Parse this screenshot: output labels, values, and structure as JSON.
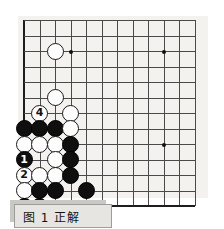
{
  "figure": {
    "caption": "图 1  正解",
    "caption_label": "图",
    "caption_number": "1",
    "caption_text": "正解"
  },
  "board": {
    "type": "go-board-diagram",
    "visible_columns": 12,
    "visible_rows": 12,
    "corner": "bottom-left",
    "line_color": "#4a4a4a",
    "edge_color": "#1d1d1d",
    "background_color": "#f3f2ef",
    "black_color": "#100f0f",
    "white_color": "#fdfdfd",
    "star_points": [
      {
        "col": 4,
        "row": 3
      },
      {
        "col": 10,
        "row": 3
      },
      {
        "col": 10,
        "row": 9
      }
    ],
    "stones": [
      {
        "col": 3,
        "row": 3,
        "color": "white",
        "label": ""
      },
      {
        "col": 3,
        "row": 6,
        "color": "white",
        "label": ""
      },
      {
        "col": 4,
        "row": 7,
        "color": "white",
        "label": ""
      },
      {
        "col": 2,
        "row": 7,
        "color": "white",
        "label": "4"
      },
      {
        "col": 1,
        "row": 8,
        "color": "black",
        "label": ""
      },
      {
        "col": 2,
        "row": 8,
        "color": "black",
        "label": ""
      },
      {
        "col": 3,
        "row": 8,
        "color": "black",
        "label": ""
      },
      {
        "col": 4,
        "row": 8,
        "color": "white",
        "label": ""
      },
      {
        "col": 1,
        "row": 9,
        "color": "white",
        "label": ""
      },
      {
        "col": 2,
        "row": 9,
        "color": "white",
        "label": ""
      },
      {
        "col": 3,
        "row": 9,
        "color": "white",
        "label": ""
      },
      {
        "col": 4,
        "row": 9,
        "color": "black",
        "label": ""
      },
      {
        "col": 1,
        "row": 10,
        "color": "black",
        "label": "1"
      },
      {
        "col": 3,
        "row": 10,
        "color": "white",
        "label": ""
      },
      {
        "col": 4,
        "row": 10,
        "color": "black",
        "label": ""
      },
      {
        "col": 1,
        "row": 11,
        "color": "white",
        "label": "2"
      },
      {
        "col": 2,
        "row": 11,
        "color": "white",
        "label": ""
      },
      {
        "col": 3,
        "row": 11,
        "color": "white",
        "label": ""
      },
      {
        "col": 4,
        "row": 11,
        "color": "black",
        "label": ""
      },
      {
        "col": 1,
        "row": 12,
        "color": "white",
        "label": ""
      },
      {
        "col": 2,
        "row": 12,
        "color": "black",
        "label": ""
      },
      {
        "col": 3,
        "row": 12,
        "color": "black",
        "label": ""
      },
      {
        "col": 5,
        "row": 12,
        "color": "black",
        "label": ""
      },
      {
        "col": 1,
        "row": 13,
        "color": "black",
        "label": "5"
      },
      {
        "col": 2,
        "row": 13,
        "color": "black",
        "label": "3"
      }
    ],
    "move_sequence": [
      {
        "number": "1",
        "color": "black"
      },
      {
        "number": "2",
        "color": "white"
      },
      {
        "number": "3",
        "color": "black"
      },
      {
        "number": "4",
        "color": "white"
      },
      {
        "number": "5",
        "color": "black"
      }
    ]
  }
}
